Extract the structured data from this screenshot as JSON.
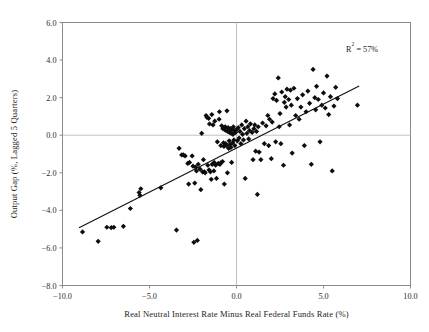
{
  "chart_data": {
    "type": "scatter",
    "title": "",
    "xlabel": "Real Neutral Interest Rate Minus Real Federal Funds Rate (%)",
    "ylabel": "Output Gap (%, Lagged 5 Quarters)",
    "xlim": [
      -10.0,
      10.0
    ],
    "ylim": [
      -8.0,
      6.0
    ],
    "xticks": [
      -10.0,
      -5.0,
      0.0,
      5.0,
      10.0
    ],
    "xticklabels": [
      "-10.0",
      "-5.0",
      "0.0",
      "5.0",
      "10.0"
    ],
    "yticks": [
      6.0,
      4.0,
      2.0,
      0.0,
      -2.0,
      -4.0,
      -6.0,
      -8.0
    ],
    "yticklabels": [
      "6.0",
      "4.0",
      "2.0",
      "0.0",
      "-2.0",
      "-4.0",
      "-6.0",
      "-8.0"
    ],
    "grid": "zero-lines-only",
    "legend": "none",
    "marker": "diamond",
    "marker_color": "#0d0d0d",
    "annotations": [
      {
        "name": "r-squared",
        "text_prefix": "R",
        "text_sup": "2",
        "text_suffix": " = 57%",
        "text": "R² = 57%",
        "x": 6.3,
        "y": 4.45
      }
    ],
    "trendline": {
      "type": "linear",
      "x0": -9.05,
      "y0": -4.92,
      "x1": 7.05,
      "y1": 2.62,
      "slope": 0.468,
      "intercept": -0.685,
      "r_squared": 0.57
    },
    "series": [
      {
        "name": "Output gap vs. real rate gap",
        "points": [
          [
            -8.85,
            -5.15
          ],
          [
            -7.95,
            -5.65
          ],
          [
            -7.45,
            -4.9
          ],
          [
            -7.2,
            -4.92
          ],
          [
            -7.05,
            -4.9
          ],
          [
            -6.5,
            -4.85
          ],
          [
            -6.1,
            -3.9
          ],
          [
            -5.6,
            -3.05
          ],
          [
            -5.55,
            -3.2
          ],
          [
            -5.5,
            -2.85
          ],
          [
            -4.35,
            -2.8
          ],
          [
            -3.45,
            -5.05
          ],
          [
            -3.3,
            -0.7
          ],
          [
            -3.15,
            -1.05
          ],
          [
            -3.05,
            -1.05
          ],
          [
            -2.95,
            -1.1
          ],
          [
            -2.8,
            -1.5
          ],
          [
            -2.75,
            -2.6
          ],
          [
            -2.7,
            -1.45
          ],
          [
            -2.55,
            -1.1
          ],
          [
            -2.5,
            -1.65
          ],
          [
            -2.45,
            -5.7
          ],
          [
            -2.4,
            -2.55
          ],
          [
            -2.35,
            -1.7
          ],
          [
            -2.3,
            -1.9
          ],
          [
            -2.25,
            -5.6
          ],
          [
            -2.2,
            -1.55
          ],
          [
            -2.1,
            -1.8
          ],
          [
            -2.05,
            -2.9
          ],
          [
            -2.0,
            0.1
          ],
          [
            -1.95,
            -1.95
          ],
          [
            -1.9,
            -1.3
          ],
          [
            -1.85,
            -1.95
          ],
          [
            -1.8,
            -2.0
          ],
          [
            -1.75,
            1.05
          ],
          [
            -1.7,
            0.95
          ],
          [
            -1.65,
            -1.6
          ],
          [
            -1.6,
            0.9
          ],
          [
            -1.58,
            -1.85
          ],
          [
            -1.55,
            0.6
          ],
          [
            -1.5,
            -1.95
          ],
          [
            -1.45,
            -2.35
          ],
          [
            -1.42,
            1.1
          ],
          [
            -1.4,
            -1.55
          ],
          [
            -1.35,
            0.55
          ],
          [
            -1.3,
            -1.9
          ],
          [
            -1.28,
            -1.45
          ],
          [
            -1.25,
            0.75
          ],
          [
            -1.2,
            -1.6
          ],
          [
            -1.15,
            -2.3
          ],
          [
            -1.1,
            -0.35
          ],
          [
            -1.05,
            -1.5
          ],
          [
            -1.0,
            0.85
          ],
          [
            -0.98,
            1.25
          ],
          [
            -0.95,
            -1.55
          ],
          [
            -0.9,
            -0.55
          ],
          [
            -0.88,
            -1.45
          ],
          [
            -0.85,
            0.5
          ],
          [
            -0.8,
            -1.4
          ],
          [
            -0.78,
            0.35
          ],
          [
            -0.75,
            -0.4
          ],
          [
            -0.72,
            -0.6
          ],
          [
            -0.7,
            -2.6
          ],
          [
            -0.68,
            0.3
          ],
          [
            -0.65,
            0.45
          ],
          [
            -0.62,
            -0.45
          ],
          [
            -0.6,
            0.25
          ],
          [
            -0.58,
            -0.55
          ],
          [
            -0.55,
            1.3
          ],
          [
            -0.52,
            -2.0
          ],
          [
            -0.5,
            0.2
          ],
          [
            -0.48,
            0.4
          ],
          [
            -0.45,
            -0.7
          ],
          [
            -0.42,
            -0.3
          ],
          [
            -0.4,
            0.15
          ],
          [
            -0.38,
            -0.5
          ],
          [
            -0.35,
            0.35
          ],
          [
            -0.32,
            -0.65
          ],
          [
            -0.3,
            0.1
          ],
          [
            -0.28,
            -1.45
          ],
          [
            -0.25,
            0.3
          ],
          [
            -0.22,
            -0.4
          ],
          [
            -0.2,
            0.05
          ],
          [
            -0.18,
            0.45
          ],
          [
            -0.15,
            -0.25
          ],
          [
            -0.12,
            0.25
          ],
          [
            -0.1,
            -0.55
          ],
          [
            -0.05,
            0.15
          ],
          [
            0.0,
            0.3
          ],
          [
            0.05,
            -0.3
          ],
          [
            0.1,
            0.4
          ],
          [
            0.15,
            -0.15
          ],
          [
            0.2,
            0.2
          ],
          [
            0.25,
            -0.45
          ],
          [
            0.3,
            0.55
          ],
          [
            0.35,
            0.05
          ],
          [
            0.4,
            -0.25
          ],
          [
            0.45,
            0.35
          ],
          [
            0.5,
            -2.3
          ],
          [
            0.55,
            0.75
          ],
          [
            0.6,
            0.1
          ],
          [
            0.65,
            0.45
          ],
          [
            0.7,
            -0.2
          ],
          [
            0.75,
            0.25
          ],
          [
            0.8,
            0.6
          ],
          [
            0.9,
            0.15
          ],
          [
            0.95,
            -1.3
          ],
          [
            1.0,
            0.35
          ],
          [
            1.05,
            0.55
          ],
          [
            1.1,
            -0.85
          ],
          [
            1.15,
            0.2
          ],
          [
            1.2,
            -3.15
          ],
          [
            1.25,
            0.45
          ],
          [
            1.3,
            -0.9
          ],
          [
            1.4,
            -1.3
          ],
          [
            1.5,
            0.65
          ],
          [
            1.6,
            -0.45
          ],
          [
            1.7,
            0.5
          ],
          [
            1.8,
            1.05
          ],
          [
            1.85,
            -0.55
          ],
          [
            1.9,
            0.85
          ],
          [
            2.0,
            -1.25
          ],
          [
            2.05,
            0.7
          ],
          [
            2.1,
            1.95
          ],
          [
            2.2,
            2.2
          ],
          [
            2.25,
            -0.35
          ],
          [
            2.3,
            1.85
          ],
          [
            2.4,
            3.05
          ],
          [
            2.45,
            0.45
          ],
          [
            2.5,
            1.15
          ],
          [
            2.55,
            -0.45
          ],
          [
            2.6,
            2.3
          ],
          [
            2.7,
            -1.6
          ],
          [
            2.75,
            1.75
          ],
          [
            2.8,
            2.05
          ],
          [
            2.85,
            1.5
          ],
          [
            2.9,
            2.45
          ],
          [
            3.0,
            1.9
          ],
          [
            3.05,
            0.55
          ],
          [
            3.1,
            2.4
          ],
          [
            3.15,
            1.6
          ],
          [
            3.2,
            -0.95
          ],
          [
            3.3,
            2.5
          ],
          [
            3.4,
            1.05
          ],
          [
            3.5,
            1.95
          ],
          [
            3.6,
            0.85
          ],
          [
            3.7,
            1.5
          ],
          [
            3.8,
            2.15
          ],
          [
            3.9,
            -0.55
          ],
          [
            4.0,
            1.25
          ],
          [
            4.1,
            2.35
          ],
          [
            4.2,
            1.7
          ],
          [
            4.3,
            -1.55
          ],
          [
            4.4,
            3.5
          ],
          [
            4.5,
            2.0
          ],
          [
            4.55,
            1.35
          ],
          [
            4.6,
            2.6
          ],
          [
            4.7,
            1.9
          ],
          [
            4.8,
            -0.35
          ],
          [
            4.9,
            1.6
          ],
          [
            5.0,
            2.25
          ],
          [
            5.1,
            1.45
          ],
          [
            5.2,
            3.15
          ],
          [
            5.3,
            1.1
          ],
          [
            5.4,
            2.05
          ],
          [
            5.5,
            -1.9
          ],
          [
            5.6,
            1.55
          ],
          [
            5.7,
            2.55
          ],
          [
            5.8,
            1.95
          ],
          [
            6.95,
            1.6
          ]
        ]
      }
    ]
  }
}
